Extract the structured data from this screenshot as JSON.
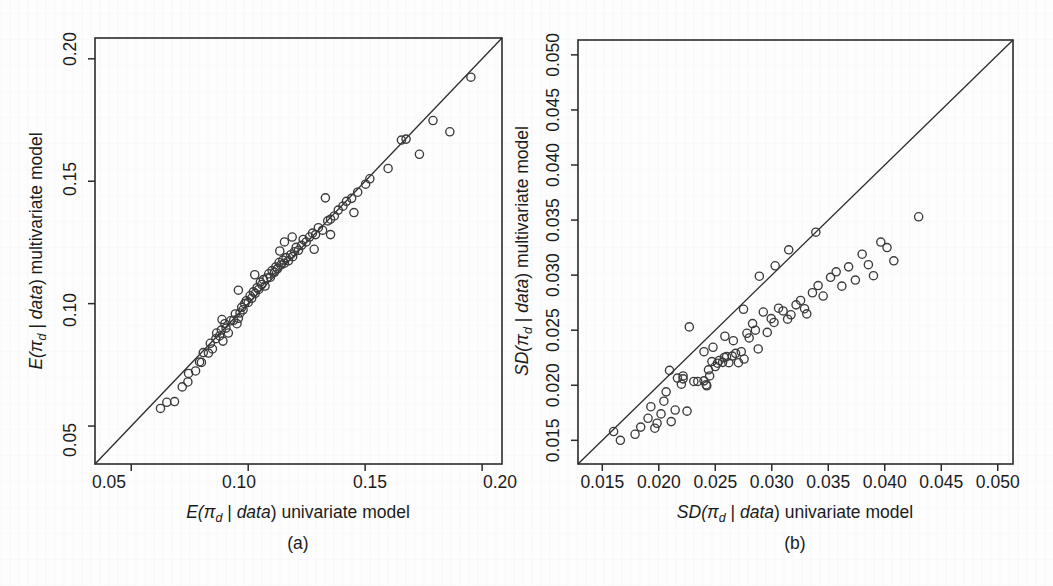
{
  "figure": {
    "title": "",
    "background_color": "#fdfdfd",
    "ink_color": "#2b2b2b",
    "point_stroke_color": "#3a3a3a"
  },
  "panels": [
    {
      "id": "a",
      "panel_label": "(a)",
      "xlabel_pre": "E(",
      "xlabel_var": "π",
      "xlabel_sub": "d",
      "xlabel_mid": " | ",
      "xlabel_data": "data",
      "xlabel_post": ") univariate model",
      "ylabel_pre": "E(",
      "ylabel_var": "π",
      "ylabel_sub": "d",
      "ylabel_mid": " | ",
      "ylabel_data": "data",
      "ylabel_post": ") multivariate model",
      "xticks": [
        "0.05",
        "0.10",
        "0.15",
        "0.20"
      ],
      "yticks": [
        "0.05",
        "0.10",
        "0.15",
        "0.20"
      ]
    },
    {
      "id": "b",
      "panel_label": "(b)",
      "xlabel_pre": "SD(",
      "xlabel_var": "π",
      "xlabel_sub": "d",
      "xlabel_mid": " | ",
      "xlabel_data": "data",
      "xlabel_post": ") univariate model",
      "ylabel_pre": "SD(",
      "ylabel_var": "π",
      "ylabel_sub": "d",
      "ylabel_mid": " | ",
      "ylabel_data": "data",
      "ylabel_post": ") multivariate model",
      "xticks": [
        "0.015",
        "0.020",
        "0.025",
        "0.030",
        "0.035",
        "0.040",
        "0.045",
        "0.050"
      ],
      "yticks": [
        "0.015",
        "0.020",
        "0.025",
        "0.030",
        "0.035",
        "0.040",
        "0.045",
        "0.050"
      ]
    }
  ],
  "chart_data": [
    {
      "type": "scatter",
      "panel": "a",
      "title": "",
      "xlabel": "E(π_d | data) univariate model",
      "ylabel": "E(π_d | data) multivariate model",
      "xlim": [
        0.0345,
        0.2085
      ],
      "ylim": [
        0.0345,
        0.2085
      ],
      "xticks": [
        0.05,
        0.1,
        0.15,
        0.2
      ],
      "yticks": [
        0.05,
        0.1,
        0.15,
        0.2
      ],
      "grid": false,
      "legend": null,
      "reference_line": {
        "type": "identity",
        "slope": 1,
        "intercept": 0
      },
      "marker": "open-circle",
      "points": [
        [
          0.0625,
          0.0572
        ],
        [
          0.0652,
          0.0597
        ],
        [
          0.0685,
          0.06
        ],
        [
          0.0718,
          0.066
        ],
        [
          0.0742,
          0.068
        ],
        [
          0.0745,
          0.0715
        ],
        [
          0.0775,
          0.0725
        ],
        [
          0.0792,
          0.0762
        ],
        [
          0.08,
          0.076
        ],
        [
          0.0808,
          0.08
        ],
        [
          0.083,
          0.0798
        ],
        [
          0.0838,
          0.0838
        ],
        [
          0.0847,
          0.0815
        ],
        [
          0.0862,
          0.0857
        ],
        [
          0.0865,
          0.088
        ],
        [
          0.0878,
          0.0868
        ],
        [
          0.0885,
          0.0892
        ],
        [
          0.0892,
          0.0847
        ],
        [
          0.09,
          0.0918
        ],
        [
          0.0905,
          0.09
        ],
        [
          0.0915,
          0.088
        ],
        [
          0.0925,
          0.093
        ],
        [
          0.0938,
          0.0932
        ],
        [
          0.0945,
          0.0958
        ],
        [
          0.0952,
          0.0918
        ],
        [
          0.0958,
          0.094
        ],
        [
          0.0965,
          0.0962
        ],
        [
          0.0972,
          0.0985
        ],
        [
          0.0978,
          0.0975
        ],
        [
          0.0985,
          0.1
        ],
        [
          0.0992,
          0.1012
        ],
        [
          0.1,
          0.1005
        ],
        [
          0.1008,
          0.1032
        ],
        [
          0.1015,
          0.1022
        ],
        [
          0.1022,
          0.1048
        ],
        [
          0.103,
          0.1042
        ],
        [
          0.1038,
          0.1065
        ],
        [
          0.1045,
          0.1058
        ],
        [
          0.1052,
          0.1088
        ],
        [
          0.1058,
          0.1078
        ],
        [
          0.1065,
          0.1098
        ],
        [
          0.1072,
          0.1072
        ],
        [
          0.108,
          0.1105
        ],
        [
          0.1088,
          0.1122
        ],
        [
          0.1095,
          0.1108
        ],
        [
          0.1102,
          0.1135
        ],
        [
          0.1112,
          0.1128
        ],
        [
          0.1118,
          0.115
        ],
        [
          0.1125,
          0.1142
        ],
        [
          0.1132,
          0.1168
        ],
        [
          0.114,
          0.1158
        ],
        [
          0.1148,
          0.1178
        ],
        [
          0.1155,
          0.1165
        ],
        [
          0.1162,
          0.1188
        ],
        [
          0.1172,
          0.1175
        ],
        [
          0.1182,
          0.12
        ],
        [
          0.119,
          0.1192
        ],
        [
          0.1198,
          0.1212
        ],
        [
          0.1205,
          0.123
        ],
        [
          0.1215,
          0.1218
        ],
        [
          0.1228,
          0.1238
        ],
        [
          0.1235,
          0.1262
        ],
        [
          0.1248,
          0.1252
        ],
        [
          0.1262,
          0.1272
        ],
        [
          0.1275,
          0.1288
        ],
        [
          0.1288,
          0.1282
        ],
        [
          0.13,
          0.131
        ],
        [
          0.1318,
          0.13
        ],
        [
          0.134,
          0.1338
        ],
        [
          0.1352,
          0.1345
        ],
        [
          0.1368,
          0.1358
        ],
        [
          0.1385,
          0.1382
        ],
        [
          0.1405,
          0.1398
        ],
        [
          0.142,
          0.1418
        ],
        [
          0.1442,
          0.143
        ],
        [
          0.1468,
          0.1455
        ],
        [
          0.1502,
          0.1488
        ],
        [
          0.152,
          0.151
        ],
        [
          0.133,
          0.1432
        ],
        [
          0.1282,
          0.1222
        ],
        [
          0.1352,
          0.1282
        ],
        [
          0.1188,
          0.1272
        ],
        [
          0.1452,
          0.1372
        ],
        [
          0.1155,
          0.1252
        ],
        [
          0.1598,
          0.1552
        ],
        [
          0.1655,
          0.1668
        ],
        [
          0.1675,
          0.1672
        ],
        [
          0.1732,
          0.161
        ],
        [
          0.179,
          0.1748
        ],
        [
          0.1862,
          0.1702
        ],
        [
          0.1952,
          0.1925
        ],
        [
          0.1135,
          0.1215
        ],
        [
          0.1028,
          0.1118
        ],
        [
          0.0958,
          0.1055
        ],
        [
          0.0888,
          0.0935
        ]
      ]
    },
    {
      "type": "scatter",
      "panel": "b",
      "title": "",
      "xlabel": "SD(π_d | data) univariate model",
      "ylabel": "SD(π_d | data) multivariate model",
      "xlim": [
        0.01285,
        0.05135
      ],
      "ylim": [
        0.01285,
        0.05135
      ],
      "xticks": [
        0.015,
        0.02,
        0.025,
        0.03,
        0.035,
        0.04,
        0.045,
        0.05
      ],
      "yticks": [
        0.015,
        0.02,
        0.025,
        0.03,
        0.035,
        0.04,
        0.045,
        0.05
      ],
      "grid": false,
      "legend": null,
      "reference_line": {
        "type": "identity",
        "slope": 1,
        "intercept": 0
      },
      "marker": "open-circle",
      "points": [
        [
          0.016,
          0.0158
        ],
        [
          0.0166,
          0.015
        ],
        [
          0.0179,
          0.01555
        ],
        [
          0.0184,
          0.0162
        ],
        [
          0.01905,
          0.017
        ],
        [
          0.0193,
          0.01805
        ],
        [
          0.01965,
          0.0161
        ],
        [
          0.01985,
          0.01655
        ],
        [
          0.0202,
          0.0174
        ],
        [
          0.02045,
          0.01855
        ],
        [
          0.02065,
          0.0194
        ],
        [
          0.0211,
          0.0167
        ],
        [
          0.02145,
          0.01775
        ],
        [
          0.02165,
          0.02065
        ],
        [
          0.022,
          0.0201
        ],
        [
          0.02215,
          0.02058
        ],
        [
          0.0225,
          0.01765
        ],
        [
          0.0231,
          0.02035
        ],
        [
          0.02345,
          0.02035
        ],
        [
          0.024,
          0.0204
        ],
        [
          0.0242,
          0.02005
        ],
        [
          0.02425,
          0.01995
        ],
        [
          0.0244,
          0.0214
        ],
        [
          0.0245,
          0.02085
        ],
        [
          0.0247,
          0.02215
        ],
        [
          0.025,
          0.0217
        ],
        [
          0.0252,
          0.022
        ],
        [
          0.02535,
          0.02225
        ],
        [
          0.02565,
          0.02208
        ],
        [
          0.0258,
          0.02252
        ],
        [
          0.026,
          0.0226
        ],
        [
          0.0262,
          0.02205
        ],
        [
          0.0265,
          0.02265
        ],
        [
          0.0266,
          0.02405
        ],
        [
          0.0268,
          0.0229
        ],
        [
          0.02705,
          0.02205
        ],
        [
          0.0273,
          0.02305
        ],
        [
          0.02755,
          0.02238
        ],
        [
          0.0278,
          0.02472
        ],
        [
          0.028,
          0.0243
        ],
        [
          0.0283,
          0.0256
        ],
        [
          0.02855,
          0.025
        ],
        [
          0.0288,
          0.0233
        ],
        [
          0.02925,
          0.02665
        ],
        [
          0.0296,
          0.0248
        ],
        [
          0.02995,
          0.02605
        ],
        [
          0.0302,
          0.0257
        ],
        [
          0.0306,
          0.027
        ],
        [
          0.031,
          0.02675
        ],
        [
          0.0314,
          0.026
        ],
        [
          0.0317,
          0.0264
        ],
        [
          0.03215,
          0.0273
        ],
        [
          0.03255,
          0.0277
        ],
        [
          0.0329,
          0.02695
        ],
        [
          0.0331,
          0.02648
        ],
        [
          0.0336,
          0.0284
        ],
        [
          0.0341,
          0.02905
        ],
        [
          0.03455,
          0.0281
        ],
        [
          0.0352,
          0.0298
        ],
        [
          0.0357,
          0.0303
        ],
        [
          0.0362,
          0.029
        ],
        [
          0.0368,
          0.03075
        ],
        [
          0.0374,
          0.02955
        ],
        [
          0.038,
          0.0319
        ],
        [
          0.03855,
          0.03095
        ],
        [
          0.039,
          0.02995
        ],
        [
          0.03965,
          0.033
        ],
        [
          0.0402,
          0.0325
        ],
        [
          0.0408,
          0.0313
        ],
        [
          0.043,
          0.0353
        ],
        [
          0.0227,
          0.0253
        ],
        [
          0.0289,
          0.0299
        ],
        [
          0.0315,
          0.0323
        ],
        [
          0.024,
          0.02305
        ],
        [
          0.02095,
          0.02135
        ],
        [
          0.02215,
          0.02085
        ],
        [
          0.0248,
          0.02345
        ],
        [
          0.0275,
          0.0269
        ],
        [
          0.0303,
          0.03085
        ],
        [
          0.0339,
          0.0339
        ],
        [
          0.02585,
          0.02445
        ]
      ]
    }
  ]
}
